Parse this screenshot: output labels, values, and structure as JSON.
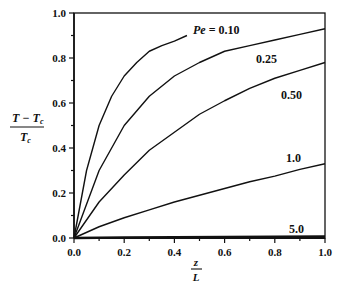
{
  "chart_data": {
    "type": "line",
    "title": "",
    "xlabel": "z/L",
    "ylabel": "(T - Tc)/Tc",
    "xlim": [
      0.0,
      1.0
    ],
    "ylim": [
      0.0,
      1.0
    ],
    "x_ticks": [
      "0.0",
      "0.2",
      "0.4",
      "0.6",
      "0.8",
      "1.0"
    ],
    "y_ticks": [
      "0.0",
      "0.2",
      "0.4",
      "0.6",
      "0.8",
      "1.0"
    ],
    "grid": false,
    "legend": "inline curve labels",
    "series": [
      {
        "name": "Pe = 0.10",
        "label": "Pe = 0.10",
        "x": [
          0.0,
          0.05,
          0.1,
          0.15,
          0.2,
          0.25,
          0.3,
          0.35,
          0.4,
          0.45
        ],
        "y": [
          0.0,
          0.3,
          0.5,
          0.63,
          0.72,
          0.78,
          0.83,
          0.855,
          0.875,
          0.9
        ]
      },
      {
        "name": "Pe = 0.25",
        "label": "0.25",
        "x": [
          0.0,
          0.1,
          0.2,
          0.3,
          0.4,
          0.5,
          0.6,
          0.7,
          0.8,
          0.9,
          1.0
        ],
        "y": [
          0.0,
          0.3,
          0.5,
          0.63,
          0.72,
          0.78,
          0.83,
          0.855,
          0.88,
          0.905,
          0.93
        ]
      },
      {
        "name": "Pe = 0.50",
        "label": "0.50",
        "x": [
          0.0,
          0.1,
          0.2,
          0.3,
          0.4,
          0.5,
          0.6,
          0.7,
          0.8,
          0.9,
          1.0
        ],
        "y": [
          0.0,
          0.16,
          0.28,
          0.39,
          0.47,
          0.55,
          0.61,
          0.665,
          0.71,
          0.745,
          0.78
        ]
      },
      {
        "name": "Pe = 1.0",
        "label": "1.0",
        "x": [
          0.0,
          0.1,
          0.2,
          0.3,
          0.4,
          0.5,
          0.6,
          0.7,
          0.8,
          0.9,
          1.0
        ],
        "y": [
          0.0,
          0.05,
          0.09,
          0.125,
          0.16,
          0.19,
          0.22,
          0.25,
          0.275,
          0.305,
          0.33
        ]
      },
      {
        "name": "Pe = 5.0",
        "label": "5.0",
        "x": [
          0.0,
          0.2,
          0.4,
          0.6,
          0.8,
          1.0
        ],
        "y": [
          0.0,
          0.002,
          0.003,
          0.004,
          0.005,
          0.006
        ]
      }
    ]
  },
  "labels": {
    "pe_010": "Pe = 0.10",
    "pe_025": "0.25",
    "pe_050": "0.50",
    "pe_10": "1.0",
    "pe_50": "5.0",
    "ylabel_num": "T − Tc",
    "ylabel_den": "Tc",
    "xlabel_num": "z",
    "xlabel_den": "L"
  },
  "colors": {
    "line": "#111111",
    "background": "#ffffff"
  }
}
